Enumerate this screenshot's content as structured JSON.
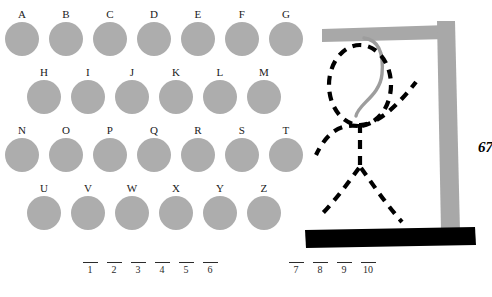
{
  "game": {
    "title": "Hangman",
    "side_counter": "67",
    "colors": {
      "letter_disc": "#adadad",
      "gallows": "#a8a8a8",
      "rope": "#9d9d9d",
      "figure": "#000000",
      "ground": "#000000",
      "background": "#ffffff",
      "text": "#1a1a1a"
    }
  },
  "letter_board": {
    "rows": [
      {
        "row_index": 0,
        "left": 5,
        "top": 8,
        "gap": 10,
        "disc_size": 34,
        "letters": [
          "A",
          "B",
          "C",
          "D",
          "E",
          "F",
          "G"
        ]
      },
      {
        "row_index": 1,
        "left": 27,
        "top": 66,
        "gap": 10,
        "disc_size": 34,
        "letters": [
          "H",
          "I",
          "J",
          "K",
          "L",
          "M"
        ]
      },
      {
        "row_index": 2,
        "left": 5,
        "top": 124,
        "gap": 10,
        "disc_size": 34,
        "letters": [
          "N",
          "O",
          "P",
          "Q",
          "R",
          "S",
          "T"
        ]
      },
      {
        "row_index": 3,
        "left": 27,
        "top": 182,
        "gap": 10,
        "disc_size": 34,
        "letters": [
          "U",
          "V",
          "W",
          "X",
          "Y",
          "Z"
        ]
      }
    ]
  },
  "answer": {
    "groups": [
      {
        "left": 78,
        "slots": [
          "1",
          "2",
          "3",
          "4",
          "5",
          "6"
        ]
      },
      {
        "left": 284,
        "slots": [
          "7",
          "8",
          "9",
          "10"
        ]
      }
    ]
  },
  "gallows": {
    "parts": [
      "crossbeam",
      "post",
      "ground",
      "rope",
      "head",
      "body",
      "left-arm",
      "right-arm",
      "left-leg",
      "right-leg"
    ]
  }
}
